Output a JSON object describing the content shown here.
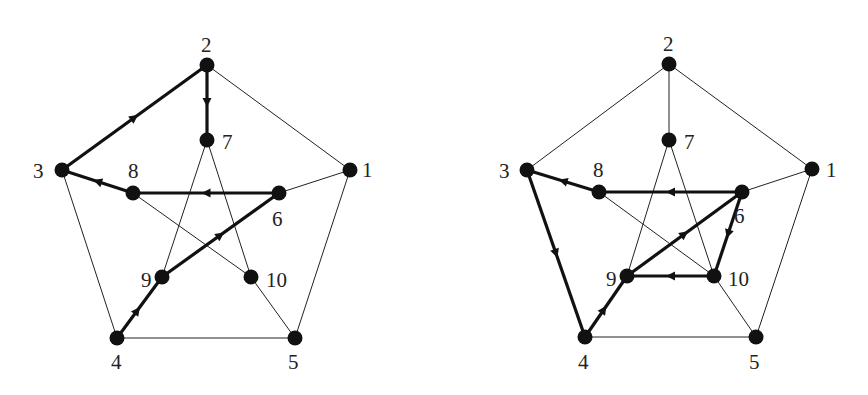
{
  "diagram": {
    "type": "graph",
    "graphs": [
      {
        "id": "left",
        "nodes": [
          {
            "id": "1",
            "label": "1",
            "x": 350,
            "y": 170,
            "lx": 362,
            "ly": 177
          },
          {
            "id": "2",
            "label": "2",
            "x": 207,
            "y": 65,
            "lx": 201,
            "ly": 52
          },
          {
            "id": "3",
            "label": "3",
            "x": 62,
            "y": 170,
            "lx": 33,
            "ly": 178
          },
          {
            "id": "4",
            "label": "4",
            "x": 117,
            "y": 338,
            "lx": 111,
            "ly": 369
          },
          {
            "id": "5",
            "label": "5",
            "x": 295,
            "y": 338,
            "lx": 288,
            "ly": 369
          },
          {
            "id": "6",
            "label": "6",
            "x": 279,
            "y": 193,
            "lx": 272,
            "ly": 226
          },
          {
            "id": "7",
            "label": "7",
            "x": 207,
            "y": 140,
            "lx": 222,
            "ly": 149
          },
          {
            "id": "8",
            "label": "8",
            "x": 133,
            "y": 193,
            "lx": 128,
            "ly": 178
          },
          {
            "id": "9",
            "label": "9",
            "x": 162,
            "y": 277,
            "lx": 141,
            "ly": 287
          },
          {
            "id": "10",
            "label": "10",
            "x": 251,
            "y": 277,
            "lx": 266,
            "ly": 287
          }
        ],
        "edges": [
          [
            "1",
            "2"
          ],
          [
            "2",
            "3"
          ],
          [
            "3",
            "4"
          ],
          [
            "4",
            "5"
          ],
          [
            "5",
            "1"
          ],
          [
            "1",
            "6"
          ],
          [
            "2",
            "7"
          ],
          [
            "3",
            "8"
          ],
          [
            "4",
            "9"
          ],
          [
            "5",
            "10"
          ],
          [
            "6",
            "8"
          ],
          [
            "8",
            "10"
          ],
          [
            "10",
            "7"
          ],
          [
            "7",
            "9"
          ],
          [
            "9",
            "6"
          ]
        ],
        "path": [
          [
            "4",
            "9"
          ],
          [
            "9",
            "6"
          ],
          [
            "6",
            "8"
          ],
          [
            "8",
            "3"
          ],
          [
            "3",
            "2"
          ],
          [
            "2",
            "7"
          ]
        ]
      },
      {
        "id": "right",
        "nodes": [
          {
            "id": "1",
            "label": "1",
            "x": 812,
            "y": 169,
            "lx": 826,
            "ly": 177
          },
          {
            "id": "2",
            "label": "2",
            "x": 669,
            "y": 64,
            "lx": 663,
            "ly": 51
          },
          {
            "id": "3",
            "label": "3",
            "x": 527,
            "y": 170,
            "lx": 499,
            "ly": 178
          },
          {
            "id": "4",
            "label": "4",
            "x": 585,
            "y": 337,
            "lx": 578,
            "ly": 369
          },
          {
            "id": "5",
            "label": "5",
            "x": 756,
            "y": 337,
            "lx": 749,
            "ly": 369
          },
          {
            "id": "6",
            "label": "6",
            "x": 742,
            "y": 192,
            "lx": 734,
            "ly": 223
          },
          {
            "id": "7",
            "label": "7",
            "x": 669,
            "y": 140,
            "lx": 684,
            "ly": 149
          },
          {
            "id": "8",
            "label": "8",
            "x": 599,
            "y": 192,
            "lx": 593,
            "ly": 177
          },
          {
            "id": "9",
            "label": "9",
            "x": 627,
            "y": 276,
            "lx": 606,
            "ly": 286
          },
          {
            "id": "10",
            "label": "10",
            "x": 714,
            "y": 276,
            "lx": 728,
            "ly": 286
          }
        ],
        "edges": [
          [
            "1",
            "2"
          ],
          [
            "2",
            "3"
          ],
          [
            "3",
            "4"
          ],
          [
            "4",
            "5"
          ],
          [
            "5",
            "1"
          ],
          [
            "1",
            "6"
          ],
          [
            "2",
            "7"
          ],
          [
            "3",
            "8"
          ],
          [
            "4",
            "9"
          ],
          [
            "5",
            "10"
          ],
          [
            "6",
            "8"
          ],
          [
            "8",
            "10"
          ],
          [
            "10",
            "7"
          ],
          [
            "7",
            "9"
          ],
          [
            "9",
            "6"
          ]
        ],
        "path": [
          [
            "4",
            "9"
          ],
          [
            "9",
            "6"
          ],
          [
            "6",
            "10"
          ],
          [
            "10",
            "9"
          ],
          [
            "6",
            "8"
          ],
          [
            "8",
            "3"
          ],
          [
            "3",
            "4"
          ]
        ]
      }
    ]
  }
}
